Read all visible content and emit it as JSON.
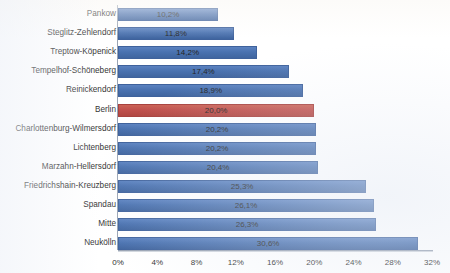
{
  "chart_data": {
    "type": "bar",
    "orientation": "horizontal",
    "title": "",
    "xlabel": "",
    "ylabel": "",
    "xlim": [
      0,
      32
    ],
    "grid": false,
    "legend": null,
    "xticks": [
      "0%",
      "4%",
      "8%",
      "12%",
      "16%",
      "20%",
      "24%",
      "28%",
      "32%"
    ],
    "xtick_values": [
      0,
      4,
      8,
      12,
      16,
      20,
      24,
      28,
      32
    ],
    "categories": [
      "Pankow",
      "Steglitz-Zehlendorf",
      "Treptow-Köpenick",
      "Tempelhof-Schöneberg",
      "Reinickendorf",
      "Berlin",
      "Charlottenburg-Wilmersdorf",
      "Lichtenberg",
      "Marzahn-Hellersdorf",
      "Friedrichshain-Kreuzberg",
      "Spandau",
      "Mitte",
      "Neukölln"
    ],
    "values": [
      10.2,
      11.8,
      14.2,
      17.4,
      18.9,
      20.0,
      20.2,
      20.2,
      20.4,
      25.3,
      26.1,
      26.3,
      30.6
    ],
    "value_labels": [
      "10,2%",
      "11,8%",
      "14,2%",
      "17,4%",
      "18,9%",
      "20,0%",
      "20,2%",
      "20,2%",
      "20,4%",
      "25,3%",
      "26,1%",
      "26,3%",
      "30,6%"
    ],
    "highlight_index": 5,
    "colors": {
      "bar": "#4a72b0",
      "bar_highlight": "#c0504d",
      "axis": "#9aa4b4",
      "text": "#2b2b2b",
      "background": "#ffffff"
    }
  }
}
